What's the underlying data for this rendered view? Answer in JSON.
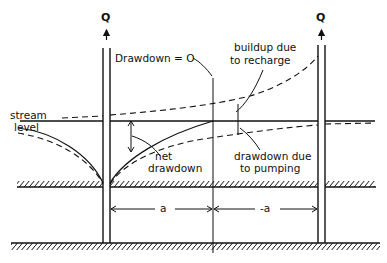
{
  "diagram": {
    "type": "well-stream interaction (image well) cross-section",
    "labels": {
      "q_left": "Q",
      "q_right": "Q",
      "drawdown_zero": "Drawdown = O",
      "buildup_line1": "buildup due",
      "buildup_line2": "to recharge",
      "stream_line1": "stream",
      "stream_line2": "level",
      "net_line1": "net",
      "net_line2": "drawdown",
      "pumping_line1": "drawdown due",
      "pumping_line2": "to pumping",
      "dist_left": "a",
      "dist_right": "-a"
    },
    "colors": {
      "ink": "#111111",
      "background": "#ffffff"
    }
  }
}
